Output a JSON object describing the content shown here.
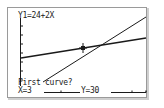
{
  "calculator": {
    "equation_label": "Y1=24+2X",
    "prompt": "First curve?",
    "x_readout": "X=3",
    "y_readout": "Y=30"
  },
  "graph": {
    "lines": [
      {
        "name": "Y1",
        "expression": "24+2X"
      },
      {
        "name": "Y2",
        "expression": "steeper line"
      }
    ],
    "cursor": {
      "x": 3,
      "y": 30
    },
    "colors": {
      "ink": "#1a1a1a",
      "background": "#ffffff",
      "border": "#9a9a9a"
    }
  }
}
